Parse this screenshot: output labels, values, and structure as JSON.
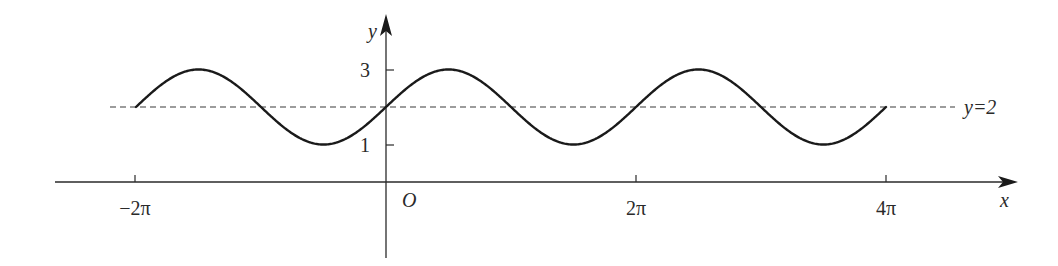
{
  "chart_data": {
    "type": "line",
    "title": "",
    "function": "y = 2 + sin x",
    "x_domain": [
      "-2π",
      "4π"
    ],
    "xlabel": "x",
    "ylabel": "y",
    "origin_label": "O",
    "x_ticks": [
      {
        "value": -6.283185,
        "label": "−2π"
      },
      {
        "value": 6.283185,
        "label": "2π"
      },
      {
        "value": 12.566371,
        "label": "4π"
      }
    ],
    "y_ticks": [
      {
        "value": 1,
        "label": "1"
      },
      {
        "value": 3,
        "label": "3"
      }
    ],
    "reference_line": {
      "y": 2,
      "label": "y=2",
      "style": "dashed"
    },
    "series": [
      {
        "name": "y = 2 + sin x",
        "x": [
          -6.283,
          -5.498,
          -4.712,
          -3.927,
          -3.142,
          -2.356,
          -1.571,
          -0.785,
          0,
          0.785,
          1.571,
          2.356,
          3.142,
          3.927,
          4.712,
          5.498,
          6.283,
          7.069,
          7.854,
          8.639,
          9.425,
          10.21,
          10.996,
          11.781,
          12.566
        ],
        "y": [
          2,
          2.707,
          3,
          2.707,
          2,
          1.293,
          1,
          1.293,
          2,
          2.707,
          3,
          2.707,
          2,
          1.293,
          1,
          1.293,
          2,
          2.707,
          3,
          2.707,
          2,
          1.293,
          1,
          1.293,
          2
        ]
      }
    ],
    "ylim": [
      -2,
      4.7
    ],
    "grid": false,
    "legend": "none",
    "colors": {
      "curve": "#1a1a1a",
      "axis": "#2a2a2a",
      "dashed": "#3a3a3a"
    }
  }
}
